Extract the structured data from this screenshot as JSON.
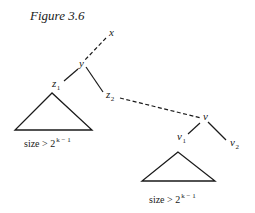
{
  "figure": {
    "title": "Figure 3.6",
    "nodes": {
      "x": {
        "label": "x",
        "sub": ""
      },
      "y": {
        "label": "y",
        "sub": ""
      },
      "z1": {
        "label": "z",
        "sub": "1"
      },
      "z2": {
        "label": "z",
        "sub": "2"
      },
      "v": {
        "label": "v",
        "sub": ""
      },
      "v1": {
        "label": "v",
        "sub": "1"
      },
      "v2": {
        "label": "v",
        "sub": "2"
      }
    },
    "edges": [
      {
        "from": "x",
        "to": "y",
        "style": "dashed"
      },
      {
        "from": "y",
        "to": "z1",
        "style": "solid"
      },
      {
        "from": "y",
        "to": "z2",
        "style": "solid"
      },
      {
        "from": "z2",
        "to": "v",
        "style": "dashed"
      },
      {
        "from": "v",
        "to": "v1",
        "style": "solid"
      },
      {
        "from": "v",
        "to": "v2",
        "style": "solid"
      }
    ],
    "subtrees": [
      {
        "root": "z1",
        "label_base": "size > 2",
        "label_exp": "k − 1"
      },
      {
        "root": "v1",
        "label_base": "size > 2",
        "label_exp": "k − 1"
      }
    ]
  }
}
